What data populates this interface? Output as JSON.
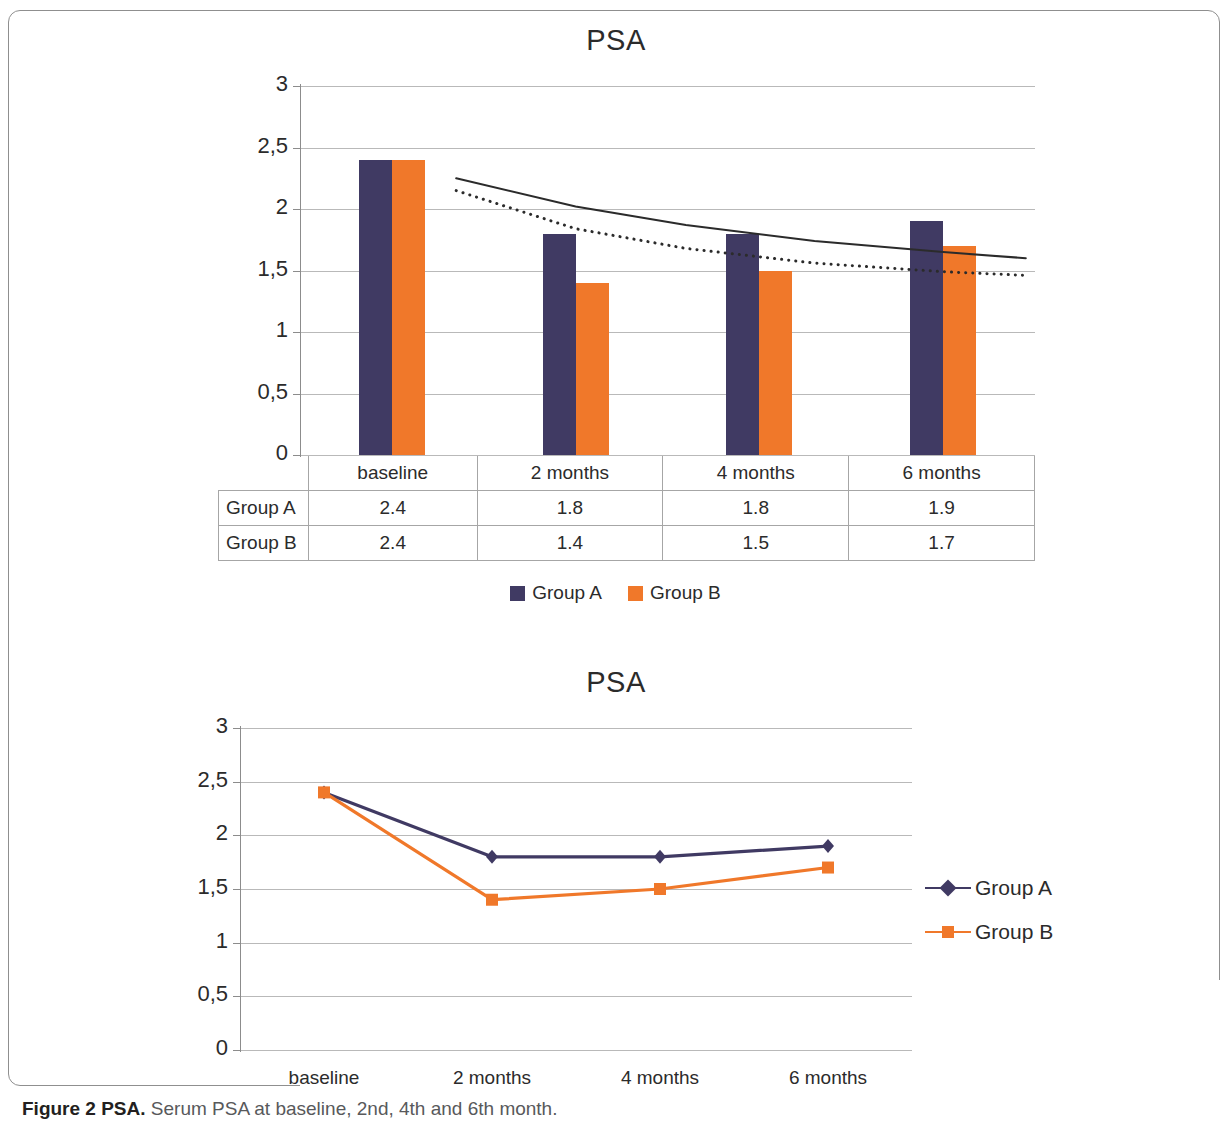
{
  "figure": {
    "caption_bold": "Figure 2 PSA.",
    "caption_rest": " Serum PSA at baseline, 2nd, 4th and 6th month."
  },
  "colors": {
    "group_a": "#403A63",
    "group_b": "#F0782A",
    "gridline": "#b9b9b9",
    "axis": "#8c8c8c",
    "text": "#2b2b2b"
  },
  "chart_data": [
    {
      "type": "bar",
      "title": "PSA",
      "xlabel": "",
      "ylabel": "",
      "categories": [
        "baseline",
        "2 months",
        "4 months",
        "6 months"
      ],
      "series": [
        {
          "name": "Group A",
          "values": [
            2.4,
            1.8,
            1.8,
            1.9
          ],
          "color": "#403A63"
        },
        {
          "name": "Group B",
          "values": [
            2.4,
            1.4,
            1.5,
            1.7
          ],
          "color": "#F0782A"
        }
      ],
      "ylim": [
        0,
        3
      ],
      "yticks": [
        "3",
        "2,5",
        "2",
        "1,5",
        "1",
        "0,5",
        "0"
      ],
      "ytick_values": [
        3,
        2.5,
        2,
        1.5,
        1,
        0.5,
        0
      ],
      "grid": true,
      "legend_position": "bottom",
      "data_table": {
        "row_labels": [
          "Group A",
          "Group B"
        ],
        "column_headers": [
          "baseline",
          "2 months",
          "4 months",
          "6 months"
        ],
        "rows": [
          [
            "2.4",
            "1.8",
            "1.8",
            "1.9"
          ],
          [
            "2.4",
            "1.4",
            "1.5",
            "1.7"
          ]
        ]
      },
      "trendlines": [
        {
          "name": "Group A trend",
          "style": "solid",
          "color": "#2b2b2b",
          "points": [
            [
              0.35,
              2.25
            ],
            [
              1.0,
              2.02
            ],
            [
              1.6,
              1.87
            ],
            [
              2.3,
              1.74
            ],
            [
              3.0,
              1.65
            ],
            [
              3.45,
              1.6
            ]
          ]
        },
        {
          "name": "Group B trend",
          "style": "dotted",
          "color": "#2b2b2b",
          "points": [
            [
              0.35,
              2.15
            ],
            [
              1.0,
              1.84
            ],
            [
              1.6,
              1.68
            ],
            [
              2.3,
              1.56
            ],
            [
              3.0,
              1.49
            ],
            [
              3.45,
              1.46
            ]
          ]
        }
      ]
    },
    {
      "type": "line",
      "title": "PSA",
      "xlabel": "",
      "ylabel": "",
      "categories": [
        "baseline",
        "2 months",
        "4 months",
        "6 months"
      ],
      "series": [
        {
          "name": "Group A",
          "values": [
            2.4,
            1.8,
            1.8,
            1.9
          ],
          "color": "#403A63",
          "marker": "diamond"
        },
        {
          "name": "Group B",
          "values": [
            2.4,
            1.4,
            1.5,
            1.7
          ],
          "color": "#F0782A",
          "marker": "square"
        }
      ],
      "ylim": [
        0,
        3
      ],
      "yticks": [
        "3",
        "2,5",
        "2",
        "1,5",
        "1",
        "0,5",
        "0"
      ],
      "ytick_values": [
        3,
        2.5,
        2,
        1.5,
        1,
        0.5,
        0
      ],
      "grid": true,
      "legend_position": "right"
    }
  ]
}
